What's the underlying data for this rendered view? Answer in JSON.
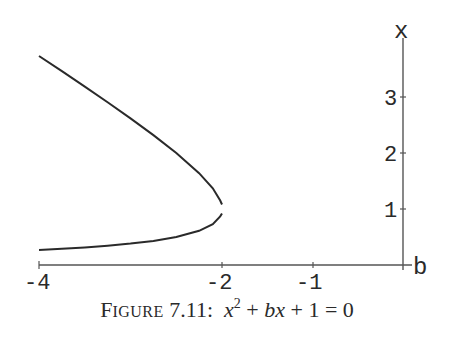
{
  "chart_data": {
    "type": "line",
    "title": "",
    "caption": {
      "prefix_first": "F",
      "prefix_rest": "IGURE",
      "number": "7.11:",
      "equation_parts": [
        "x",
        "2",
        " + ",
        "bx",
        " + 1 = 0"
      ],
      "equation_text": "x^2 + bx + 1 = 0"
    },
    "xlabel": "b",
    "ylabel": "x",
    "xlim": [
      -4,
      0
    ],
    "ylim": [
      0,
      3.9
    ],
    "xticks": [
      -4,
      -2,
      -1
    ],
    "xtick_labels": [
      "-4",
      "-2",
      "-1"
    ],
    "yticks": [
      1,
      2,
      3
    ],
    "ytick_labels": [
      "1",
      "2",
      "3"
    ],
    "grid": false,
    "legend": null,
    "series": [
      {
        "name": "upper root x = (-b + sqrt(b^2-4))/2",
        "b": [
          -4,
          -3.75,
          -3.5,
          -3.25,
          -3,
          -2.75,
          -2.5,
          -2.25,
          -2.1,
          -2.02,
          -2.0
        ],
        "x": [
          3.732,
          3.461,
          3.186,
          2.906,
          2.618,
          2.319,
          2.0,
          1.64,
          1.37,
          1.152,
          1.08
        ]
      },
      {
        "name": "lower root x = (-b - sqrt(b^2-4))/2",
        "b": [
          -4,
          -3.75,
          -3.5,
          -3.25,
          -3,
          -2.75,
          -2.5,
          -2.25,
          -2.1,
          -2.02,
          -2.0
        ],
        "x": [
          0.268,
          0.289,
          0.314,
          0.344,
          0.382,
          0.431,
          0.5,
          0.61,
          0.73,
          0.868,
          0.92
        ]
      }
    ],
    "colors": {
      "curve": "#2a2a2a",
      "axis": "#555555",
      "text": "#2a2a2a",
      "background": "#ffffff"
    }
  }
}
